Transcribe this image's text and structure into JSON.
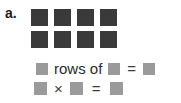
{
  "problem": {
    "label": "a.",
    "array": {
      "rows": 2,
      "columns": 4,
      "total": 8,
      "cell_color": "#3a3a3a",
      "cells": [
        {
          "row": 1,
          "col": 1
        },
        {
          "row": 1,
          "col": 2
        },
        {
          "row": 1,
          "col": 3
        },
        {
          "row": 1,
          "col": 4
        },
        {
          "row": 2,
          "col": 1
        },
        {
          "row": 2,
          "col": 2
        },
        {
          "row": 2,
          "col": 3
        },
        {
          "row": 2,
          "col": 4
        }
      ]
    },
    "blank_color": "#9a9a9a",
    "equations": [
      {
        "id": "rows-of-equation",
        "parts": [
          {
            "kind": "blank",
            "name": "rows-blank",
            "value": ""
          },
          {
            "kind": "text",
            "name": "rows-of-text",
            "value": "rows of"
          },
          {
            "kind": "blank",
            "name": "columns-blank",
            "value": ""
          },
          {
            "kind": "operator",
            "name": "equals-sign",
            "value": "="
          },
          {
            "kind": "blank",
            "name": "total-blank",
            "value": ""
          }
        ]
      },
      {
        "id": "multiplication-equation",
        "parts": [
          {
            "kind": "blank",
            "name": "factor-one-blank",
            "value": ""
          },
          {
            "kind": "operator",
            "name": "multiplication-sign",
            "value": "×"
          },
          {
            "kind": "blank",
            "name": "factor-two-blank",
            "value": ""
          },
          {
            "kind": "operator",
            "name": "equals-sign",
            "value": "="
          },
          {
            "kind": "blank",
            "name": "product-blank",
            "value": ""
          }
        ]
      }
    ]
  }
}
